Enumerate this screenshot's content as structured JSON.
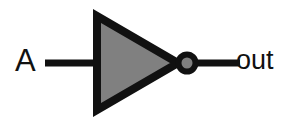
{
  "diagram": {
    "background_color": "#ffffff",
    "stroke_color": "#111111",
    "fill_color": "#808080",
    "input_label": "A",
    "output_label": "out",
    "gate_type": "NOT",
    "symbol_shape": "triangle-with-inversion-bubble",
    "geometry": {
      "triangle_left_x": 93,
      "triangle_top_y": 12,
      "triangle_bottom_y": 118,
      "triangle_apex_x": 179,
      "centerline_y": 63,
      "bubble_center_x": 187,
      "bubble_radius": 8.5,
      "input_wire_start_x": 45,
      "input_wire_end_x": 95,
      "output_wire_start_x": 195,
      "output_wire_end_x": 240,
      "stroke_width": 8,
      "wire_width": 7
    }
  }
}
